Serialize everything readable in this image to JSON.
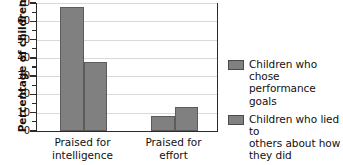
{
  "chart_data": {
    "type": "bar",
    "title": "",
    "subtitle": "",
    "xlabel": "",
    "ylabel": "Percentage of children",
    "ylim": [
      0,
      70
    ],
    "ytick_step": 10,
    "yticks": [
      0,
      10,
      20,
      30,
      40,
      50,
      60,
      70
    ],
    "ytick_labels": [
      "0",
      "10",
      "20",
      "30",
      "40",
      "50",
      "60",
      "70"
    ],
    "yminor_ticks": [
      5,
      15,
      25,
      35,
      45,
      55,
      65
    ],
    "grid": true,
    "grid_axis": "y",
    "legend_position": "right",
    "categories": [
      "Praised for intelligence",
      "Praised for effort"
    ],
    "category_lines": [
      [
        "Praised for",
        "intelligence"
      ],
      [
        "Praised for",
        "effort"
      ]
    ],
    "series": [
      {
        "name": "Children who chose performance goals",
        "name_lines": [
          "Children who chose",
          "performance goals"
        ],
        "color": "#808080",
        "values": [
          68,
          8
        ]
      },
      {
        "name": "Children who lied to others about how they did",
        "name_lines": [
          "Children who lied to",
          "others about how",
          "they did"
        ],
        "color": "#808080",
        "values": [
          38,
          13
        ]
      }
    ]
  },
  "figure": {
    "bar_fill_color": "#808080",
    "bar_edge_color": "#5c5c5c",
    "grid_color": "#d9d9d9",
    "axis_color": "#2b2b2b",
    "background_color": "#ffffff",
    "top_artifact_text": " "
  }
}
